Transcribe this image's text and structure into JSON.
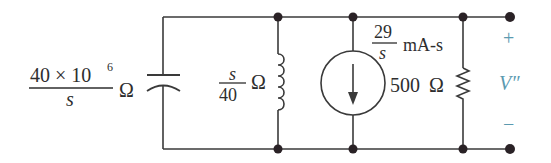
{
  "diagram": {
    "type": "s-domain circuit",
    "colors": {
      "wire": "#3a3a3a",
      "node": "#2a2226",
      "text": "#2e2e2e",
      "polarity": "#5b9ab0"
    },
    "capacitor": {
      "impedance_numerator": "40 × 10",
      "impedance_exponent": "6",
      "impedance_denominator": "s",
      "unit": "Ω"
    },
    "inductor": {
      "impedance_numerator": "s",
      "impedance_denominator": "40",
      "unit": "Ω"
    },
    "current_source": {
      "value_numerator": "29",
      "value_denominator": "s",
      "unit": "mA-s",
      "direction": "down"
    },
    "resistor": {
      "value": "500",
      "unit": "Ω"
    },
    "output": {
      "plus": "+",
      "label": "V″",
      "minus": "−"
    }
  }
}
